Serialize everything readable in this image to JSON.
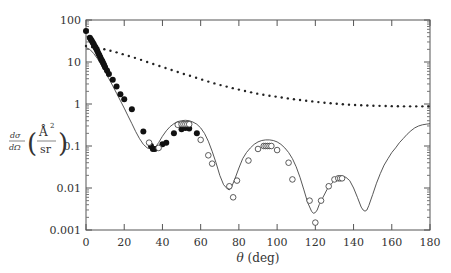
{
  "chart_data": {
    "type": "line",
    "title": "",
    "xlabel": "θ (deg)",
    "ylabel": "dσ/dΩ (Å²/sr)",
    "ylabel_parts": {
      "frac_num": "dσ",
      "frac_den": "dΩ",
      "unit_num": "Å",
      "unit_sup": "2",
      "unit_den": "sr"
    },
    "xlim": [
      0,
      180
    ],
    "ylim": [
      0.001,
      100
    ],
    "yscale": "log",
    "grid": false,
    "xticks": [
      0,
      20,
      40,
      60,
      80,
      100,
      120,
      140,
      160,
      180
    ],
    "xtick_labels": [
      "0",
      "20",
      "40",
      "60",
      "80",
      "100",
      "120",
      "140",
      "160",
      "180"
    ],
    "yticks": [
      0.001,
      0.01,
      0.1,
      1,
      10,
      100
    ],
    "ytick_labels": [
      "0.001",
      "0.01",
      "0.1",
      "1",
      "10",
      "100"
    ],
    "series": [
      {
        "name": "theory (solid)",
        "style": "solid",
        "x": [
          0,
          2,
          4,
          6,
          8,
          10,
          12,
          14,
          16,
          18,
          20,
          22,
          24,
          26,
          28,
          30,
          32,
          34,
          35,
          36,
          38,
          40,
          42,
          44,
          46,
          48,
          50,
          52,
          54,
          56,
          58,
          60,
          62,
          64,
          66,
          68,
          70,
          72,
          74,
          75,
          76,
          78,
          80,
          82,
          84,
          86,
          88,
          90,
          92,
          94,
          96,
          98,
          100,
          102,
          104,
          106,
          108,
          110,
          112,
          114,
          116,
          118,
          119,
          120,
          121,
          122,
          124,
          126,
          128,
          130,
          132,
          134,
          136,
          138,
          140,
          142,
          144,
          145,
          146,
          147,
          148,
          150,
          152,
          154,
          156,
          158,
          160,
          162,
          164,
          166,
          168,
          170,
          172,
          174,
          176,
          178,
          180
        ],
        "y": [
          22,
          20,
          16,
          12,
          8.5,
          5.8,
          4.0,
          2.7,
          1.8,
          1.2,
          0.8,
          0.52,
          0.34,
          0.22,
          0.15,
          0.11,
          0.09,
          0.085,
          0.085,
          0.09,
          0.12,
          0.17,
          0.23,
          0.29,
          0.34,
          0.38,
          0.4,
          0.41,
          0.4,
          0.37,
          0.33,
          0.27,
          0.2,
          0.13,
          0.075,
          0.04,
          0.02,
          0.012,
          0.0095,
          0.009,
          0.01,
          0.017,
          0.03,
          0.05,
          0.07,
          0.09,
          0.11,
          0.125,
          0.135,
          0.14,
          0.14,
          0.135,
          0.125,
          0.11,
          0.09,
          0.07,
          0.05,
          0.032,
          0.018,
          0.009,
          0.0045,
          0.0028,
          0.0025,
          0.0026,
          0.003,
          0.004,
          0.006,
          0.009,
          0.012,
          0.015,
          0.018,
          0.019,
          0.018,
          0.015,
          0.01,
          0.006,
          0.0035,
          0.003,
          0.0028,
          0.003,
          0.0038,
          0.007,
          0.013,
          0.022,
          0.035,
          0.05,
          0.07,
          0.09,
          0.12,
          0.15,
          0.19,
          0.23,
          0.27,
          0.3,
          0.32,
          0.33,
          0.34
        ]
      },
      {
        "name": "dotted curve",
        "style": "dotted",
        "x": [
          0,
          5,
          10,
          15,
          20,
          25,
          30,
          35,
          40,
          45,
          50,
          55,
          60,
          65,
          70,
          75,
          80,
          85,
          90,
          95,
          100,
          105,
          110,
          115,
          120,
          125,
          130,
          135,
          140,
          145,
          150,
          155,
          160,
          165,
          170,
          175,
          180
        ],
        "y": [
          24,
          22,
          20,
          17.5,
          15,
          12.8,
          10.8,
          9.0,
          7.6,
          6.4,
          5.4,
          4.6,
          3.9,
          3.3,
          2.85,
          2.5,
          2.2,
          1.95,
          1.75,
          1.6,
          1.48,
          1.37,
          1.28,
          1.2,
          1.13,
          1.07,
          1.02,
          0.98,
          0.95,
          0.93,
          0.91,
          0.9,
          0.89,
          0.88,
          0.88,
          0.88,
          0.88
        ]
      },
      {
        "name": "filled circles",
        "marker": "filled",
        "x": [
          0,
          2,
          2.5,
          3,
          3.5,
          4,
          4.5,
          5,
          5.5,
          6,
          6.5,
          7,
          7.5,
          8,
          8.5,
          9,
          9.5,
          10,
          11,
          12,
          14,
          16,
          18,
          20,
          24,
          30,
          34,
          35,
          36,
          40,
          42,
          46,
          50,
          52,
          54,
          58
        ],
        "y": [
          55,
          38,
          35,
          32,
          29,
          27,
          24,
          22,
          20,
          18,
          16,
          14.5,
          13,
          11.5,
          10.5,
          9.5,
          8.5,
          7.5,
          6.3,
          5.2,
          3.8,
          2.6,
          1.7,
          1.3,
          0.75,
          0.22,
          0.1,
          0.085,
          0.085,
          0.11,
          0.12,
          0.2,
          0.25,
          0.27,
          0.26,
          0.2
        ]
      },
      {
        "name": "open circles",
        "marker": "open",
        "x": [
          33,
          38,
          48,
          50,
          51,
          52,
          53,
          54,
          60,
          64,
          66,
          75,
          77,
          79,
          85,
          90,
          93,
          94,
          95,
          96,
          97,
          100,
          106,
          108,
          117,
          120,
          123,
          127,
          130,
          132,
          133,
          134
        ],
        "y": [
          0.12,
          0.09,
          0.32,
          0.33,
          0.33,
          0.33,
          0.33,
          0.33,
          0.14,
          0.06,
          0.038,
          0.011,
          0.006,
          0.015,
          0.045,
          0.085,
          0.1,
          0.1,
          0.1,
          0.1,
          0.1,
          0.08,
          0.04,
          0.016,
          0.005,
          0.0015,
          0.005,
          0.011,
          0.016,
          0.017,
          0.017,
          0.017
        ]
      }
    ]
  }
}
